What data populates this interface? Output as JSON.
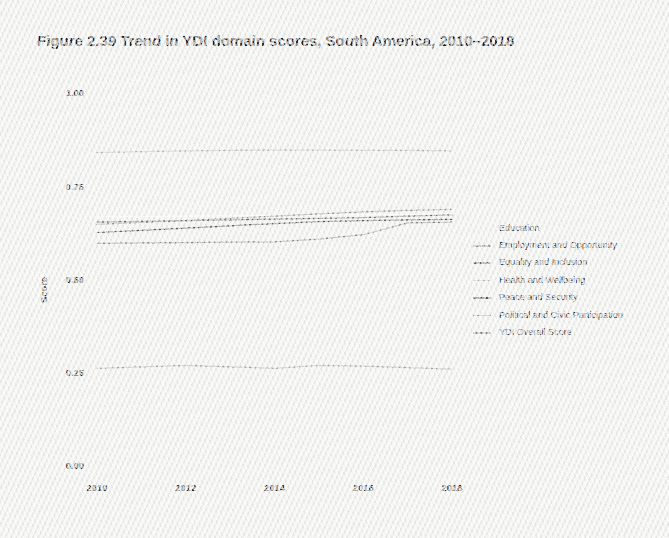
{
  "figure": {
    "title": "Figure 2.39  Trend in YDI domain scores, South America, 2010–2018"
  },
  "axes": {
    "y_title": "Score",
    "y_ticks": [
      "1.00",
      "0.75",
      "0.50",
      "0.25",
      "0.00"
    ],
    "x_ticks": [
      "2010",
      "2012",
      "2014",
      "2016",
      "2018"
    ]
  },
  "legend": {
    "items": [
      {
        "label": "Education",
        "color": "#ffffff",
        "visible_swatch": false
      },
      {
        "label": "Employment and Opportunity",
        "color": "#9a9a9a",
        "visible_swatch": true
      },
      {
        "label": "Equality and Inclusion",
        "color": "#6f6f6f",
        "visible_swatch": true
      },
      {
        "label": "Health and Wellbeing",
        "color": "#b9b9b9",
        "visible_swatch": true
      },
      {
        "label": "Peace and Security",
        "color": "#5a5a5a",
        "visible_swatch": true
      },
      {
        "label": "Political and Civic Participation",
        "color": "#a8a8a8",
        "visible_swatch": true
      },
      {
        "label": "YDI Overall Score",
        "color": "#8c8c8c",
        "visible_swatch": true
      }
    ]
  },
  "chart_data": {
    "type": "line",
    "title": "Figure 2.39  Trend in YDI domain scores, South America, 2010–2018",
    "xlabel": "",
    "ylabel": "Score",
    "xlim": [
      2010,
      2018
    ],
    "ylim": [
      0.0,
      1.0
    ],
    "yticks": [
      0.0,
      0.25,
      0.5,
      0.75,
      1.0
    ],
    "xticks": [
      2010,
      2012,
      2014,
      2016,
      2018
    ],
    "grid": false,
    "legend_position": "right",
    "x": [
      2010,
      2011,
      2012,
      2013,
      2014,
      2015,
      2016,
      2017,
      2018
    ],
    "series": [
      {
        "name": "Education",
        "color": "#ffffff",
        "values": [
          0.668,
          0.669,
          0.67,
          0.671,
          0.672,
          0.673,
          0.674,
          0.675,
          0.676
        ]
      },
      {
        "name": "Employment and Opportunity",
        "color": "#9a9a9a",
        "values": [
          0.648,
          0.653,
          0.658,
          0.664,
          0.67,
          0.676,
          0.681,
          0.685,
          0.688
        ]
      },
      {
        "name": "Equality and Inclusion",
        "color": "#6f6f6f",
        "values": [
          0.654,
          0.656,
          0.658,
          0.66,
          0.662,
          0.664,
          0.666,
          0.67,
          0.673
        ]
      },
      {
        "name": "Health and Wellbeing",
        "color": "#b9b9b9",
        "values": [
          0.84,
          0.843,
          0.845,
          0.846,
          0.847,
          0.847,
          0.846,
          0.846,
          0.845
        ]
      },
      {
        "name": "Peace and Security",
        "color": "#5a5a5a",
        "values": [
          0.626,
          0.632,
          0.638,
          0.644,
          0.65,
          0.655,
          0.658,
          0.66,
          0.661
        ]
      },
      {
        "name": "Political and Civic Participation",
        "color": "#a8a8a8",
        "values": [
          0.262,
          0.266,
          0.27,
          0.266,
          0.262,
          0.27,
          0.268,
          0.264,
          0.26
        ]
      },
      {
        "name": "YDI Overall Score",
        "color": "#8c8c8c",
        "values": [
          0.597,
          0.598,
          0.599,
          0.6,
          0.601,
          0.608,
          0.62,
          0.652,
          0.654
        ]
      }
    ]
  }
}
